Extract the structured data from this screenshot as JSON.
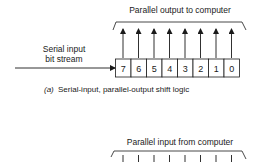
{
  "diagram_a": {
    "title": "Parallel output to computer",
    "input_label_line1": "Serial input",
    "input_label_line2": "bit stream",
    "bits": [
      "7",
      "6",
      "5",
      "4",
      "3",
      "2",
      "1",
      "0"
    ],
    "caption_letter": "(a)",
    "caption_text": "Serial-input, parallel-output shift logic"
  },
  "diagram_b": {
    "title": "Parallel input from computer"
  }
}
